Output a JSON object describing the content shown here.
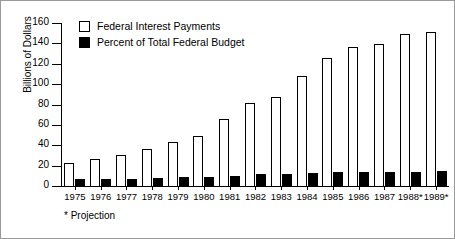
{
  "chart_data": {
    "type": "bar",
    "title": "",
    "xlabel": "",
    "ylabel": "Billions of Dollars",
    "ylim": [
      0,
      160
    ],
    "yticks": [
      0,
      20,
      40,
      60,
      80,
      100,
      120,
      140,
      160
    ],
    "grid": false,
    "legend_position": "top-left",
    "categories": [
      "1975",
      "1976",
      "1977",
      "1978",
      "1979",
      "1980",
      "1981",
      "1982",
      "1983",
      "1984",
      "1985",
      "1986",
      "1987",
      "1988*",
      "1989*"
    ],
    "series": [
      {
        "name": "Federal Interest Payments",
        "color": "#ffffff",
        "values": [
          23,
          27,
          30,
          36,
          43,
          49,
          66,
          81,
          87,
          108,
          126,
          136,
          139,
          149,
          151
        ]
      },
      {
        "name": "Percent of Total Federal Budget",
        "color": "#000000",
        "values": [
          7,
          7,
          7,
          8,
          9,
          9,
          10,
          12,
          12,
          13,
          14,
          14,
          14,
          14,
          15
        ]
      }
    ],
    "annotations": [
      "* Projection"
    ]
  },
  "legend": {
    "items": [
      {
        "label": "Federal Interest Payments",
        "swatch": "hollow-square-icon"
      },
      {
        "label": "Percent of Total Federal Budget",
        "swatch": "filled-square-icon"
      }
    ]
  },
  "axis": {
    "y_title": "Billions of Dollars"
  },
  "footnote": {
    "text": "* Projection"
  }
}
